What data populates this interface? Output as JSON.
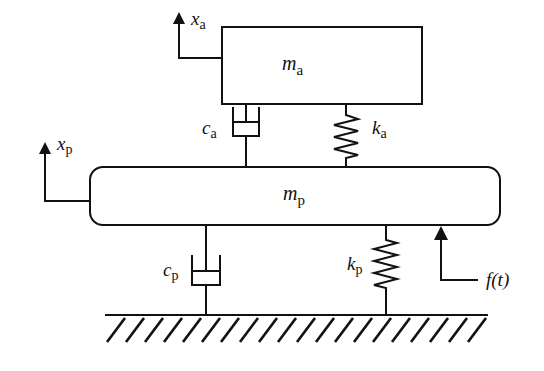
{
  "diagram": {
    "masses": {
      "absorber": {
        "symbol": "m",
        "subscript": "a"
      },
      "primary": {
        "symbol": "m",
        "subscript": "p"
      }
    },
    "displacements": {
      "absorber": {
        "symbol": "x",
        "subscript": "a"
      },
      "primary": {
        "symbol": "x",
        "subscript": "p"
      }
    },
    "dampers": {
      "absorber": {
        "symbol": "c",
        "subscript": "a"
      },
      "primary": {
        "symbol": "c",
        "subscript": "p"
      }
    },
    "springs": {
      "absorber": {
        "symbol": "k",
        "subscript": "a"
      },
      "primary": {
        "symbol": "k",
        "subscript": "p"
      }
    },
    "force": {
      "label": "f(t)"
    },
    "colors": {
      "stroke": "#111111",
      "background": "#ffffff"
    }
  }
}
